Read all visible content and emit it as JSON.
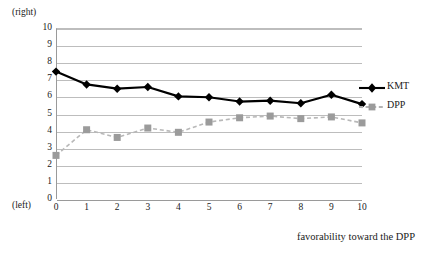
{
  "axis_anchors": {
    "top_label": "(right)",
    "bottom_label": "(left)"
  },
  "chart_data": {
    "type": "line",
    "title": "",
    "subtitle": "",
    "xlabel": "favorability toward the DPP",
    "ylabel": "",
    "xlim": [
      0,
      10
    ],
    "ylim": [
      0,
      10
    ],
    "grid": true,
    "legend_position": "right",
    "x": [
      0,
      1,
      2,
      3,
      4,
      5,
      6,
      7,
      8,
      9,
      10
    ],
    "categories": [
      "0",
      "1",
      "2",
      "3",
      "4",
      "5",
      "6",
      "7",
      "8",
      "9",
      "10"
    ],
    "ytick_labels": [
      "0",
      "1",
      "2",
      "3",
      "4",
      "5",
      "6",
      "7",
      "8",
      "9",
      "10"
    ],
    "ytick_values": [
      0,
      1,
      2,
      3,
      4,
      5,
      6,
      7,
      8,
      9,
      10
    ],
    "y_axis_top_note": "(right)",
    "y_axis_bottom_note": "(left)",
    "series": [
      {
        "name": "KMT",
        "color": "#000000",
        "marker": "diamond",
        "line_style": "solid",
        "values": [
          7.45,
          6.7,
          6.45,
          6.55,
          6.0,
          5.95,
          5.7,
          5.75,
          5.6,
          6.1,
          5.55
        ]
      },
      {
        "name": "DPP",
        "color": "#9b9b9b",
        "marker": "square",
        "line_style": "dashed",
        "values": [
          2.55,
          4.05,
          3.6,
          4.15,
          3.9,
          4.5,
          4.75,
          4.85,
          4.7,
          4.8,
          4.45
        ]
      }
    ]
  },
  "legend": {
    "items": [
      {
        "label": "KMT"
      },
      {
        "label": "DPP"
      }
    ]
  }
}
